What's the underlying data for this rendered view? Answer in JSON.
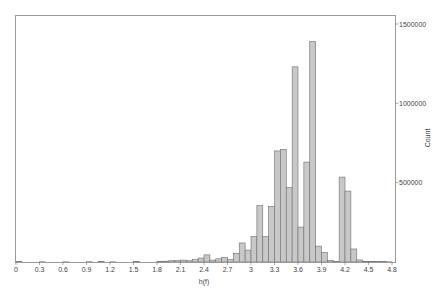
{
  "chart_data": {
    "type": "bar",
    "title": "",
    "xlabel": "h(f)",
    "ylabel": "Count",
    "xlim": [
      0,
      4.8
    ],
    "ylim": [
      0,
      1500000
    ],
    "y_axis_position": "right",
    "grid": false,
    "legend": null,
    "bin_width": 0.075,
    "x_ticks": [
      "0",
      "0.3",
      "0.6",
      "0.9",
      "1.2",
      "1.5",
      "1.8",
      "2.1",
      "2.4",
      "2.7",
      "3",
      "3.3",
      "3.6",
      "3.9",
      "4.2",
      "4.5",
      "4.8"
    ],
    "y_ticks": [
      "500000",
      "1000000",
      "1500000"
    ],
    "bins": [
      {
        "x": 0.0,
        "count": 2000
      },
      {
        "x": 0.3,
        "count": 1000
      },
      {
        "x": 0.6,
        "count": 1000
      },
      {
        "x": 0.9,
        "count": 1500
      },
      {
        "x": 1.05,
        "count": 2000
      },
      {
        "x": 1.2,
        "count": 1000
      },
      {
        "x": 1.5,
        "count": 2500
      },
      {
        "x": 1.8,
        "count": 3000
      },
      {
        "x": 1.875,
        "count": 5000
      },
      {
        "x": 1.95,
        "count": 8000
      },
      {
        "x": 2.025,
        "count": 9000
      },
      {
        "x": 2.1,
        "count": 12000
      },
      {
        "x": 2.175,
        "count": 8000
      },
      {
        "x": 2.25,
        "count": 15000
      },
      {
        "x": 2.325,
        "count": 25000
      },
      {
        "x": 2.4,
        "count": 45000
      },
      {
        "x": 2.475,
        "count": 12000
      },
      {
        "x": 2.55,
        "count": 20000
      },
      {
        "x": 2.625,
        "count": 30000
      },
      {
        "x": 2.7,
        "count": 15000
      },
      {
        "x": 2.775,
        "count": 55000
      },
      {
        "x": 2.85,
        "count": 120000
      },
      {
        "x": 2.925,
        "count": 75000
      },
      {
        "x": 3.0,
        "count": 160000
      },
      {
        "x": 3.075,
        "count": 355000
      },
      {
        "x": 3.15,
        "count": 160000
      },
      {
        "x": 3.225,
        "count": 350000
      },
      {
        "x": 3.3,
        "count": 700000
      },
      {
        "x": 3.375,
        "count": 710000
      },
      {
        "x": 3.45,
        "count": 470000
      },
      {
        "x": 3.525,
        "count": 1230000
      },
      {
        "x": 3.6,
        "count": 220000
      },
      {
        "x": 3.675,
        "count": 630000
      },
      {
        "x": 3.75,
        "count": 1390000
      },
      {
        "x": 3.825,
        "count": 100000
      },
      {
        "x": 3.9,
        "count": 60000
      },
      {
        "x": 3.975,
        "count": 10000
      },
      {
        "x": 4.05,
        "count": 2000
      },
      {
        "x": 4.125,
        "count": 535000
      },
      {
        "x": 4.2,
        "count": 447000
      },
      {
        "x": 4.275,
        "count": 82000
      },
      {
        "x": 4.35,
        "count": 13000
      },
      {
        "x": 4.425,
        "count": 4000
      },
      {
        "x": 4.5,
        "count": 3000
      },
      {
        "x": 4.575,
        "count": 2000
      },
      {
        "x": 4.65,
        "count": 2000
      },
      {
        "x": 4.725,
        "count": 1000
      }
    ]
  },
  "axes": {
    "x_label": "h(f)",
    "y_label": "Count"
  },
  "style": {
    "bar_fill": "#c8c8c8",
    "bar_stroke": "#6e6e6e",
    "frame_color": "#9a9a9a"
  }
}
